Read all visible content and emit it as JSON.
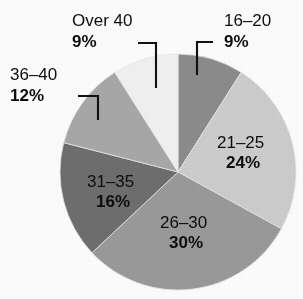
{
  "chart_data": {
    "type": "pie",
    "title": "",
    "subtitle": "",
    "xlabel": "",
    "ylabel": "",
    "legend_position": "none",
    "grid": false,
    "start_angle_deg": 0,
    "direction": "clockwise",
    "categories": [
      "16–20",
      "21–25",
      "26–30",
      "31–35",
      "36–40",
      "Over 40"
    ],
    "values": [
      9,
      24,
      30,
      16,
      12,
      9
    ],
    "value_suffix": "%",
    "value_labels": [
      "9%",
      "24%",
      "30%",
      "16%",
      "12%",
      "9%"
    ],
    "colors": [
      "#8c8c8c",
      "#cdcdcd",
      "#9a9a9a",
      "#6e6e6e",
      "#a8a8a8",
      "#f1f1f1"
    ],
    "slices": [
      {
        "category": "16–20",
        "value": 9,
        "value_label": "9%",
        "color": "#8c8c8c",
        "label_placement": "outside",
        "start_deg": 0,
        "end_deg": 32.4
      },
      {
        "category": "21–25",
        "value": 24,
        "value_label": "24%",
        "color": "#cdcdcd",
        "label_placement": "inside",
        "start_deg": 32.4,
        "end_deg": 118.8
      },
      {
        "category": "26–30",
        "value": 30,
        "value_label": "30%",
        "color": "#9a9a9a",
        "label_placement": "inside",
        "start_deg": 118.8,
        "end_deg": 226.8
      },
      {
        "category": "31–35",
        "value": 16,
        "value_label": "16%",
        "color": "#6e6e6e",
        "label_placement": "inside",
        "start_deg": 226.8,
        "end_deg": 284.4
      },
      {
        "category": "36–40",
        "value": 12,
        "value_label": "12%",
        "color": "#a8a8a8",
        "label_placement": "outside",
        "start_deg": 284.4,
        "end_deg": 327.6
      },
      {
        "category": "Over 40",
        "value": 9,
        "value_label": "9%",
        "color": "#f1f1f1",
        "label_placement": "outside",
        "start_deg": 327.6,
        "end_deg": 360
      }
    ]
  },
  "labels": {
    "over40": {
      "category": "Over 40",
      "percent": "9%"
    },
    "age16_20": {
      "category": "16–20",
      "percent": "9%"
    },
    "age36_40": {
      "category": "36–40",
      "percent": "12%"
    },
    "age21_25": {
      "category": "21–25",
      "percent": "24%"
    },
    "age26_30": {
      "category": "26–30",
      "percent": "30%"
    },
    "age31_35": {
      "category": "31–35",
      "percent": "16%"
    }
  }
}
